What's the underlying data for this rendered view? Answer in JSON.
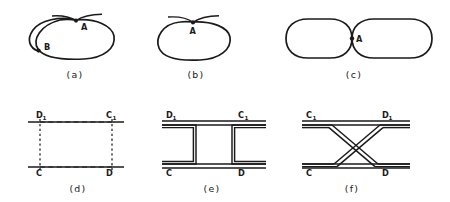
{
  "figure": {
    "background_color": "#ffffff",
    "ink_color": "#1a1a1a",
    "panel_count": 6
  },
  "panels": [
    {
      "id": "a",
      "caption": "(a)",
      "caption_x": 75,
      "caption_y": 78,
      "description": "closed loop with an interior sub-loop, marked points A and B",
      "labels": [
        {
          "name": "point-a",
          "text": "A",
          "subscript": "",
          "x": 81,
          "y": 30
        },
        {
          "name": "point-b",
          "text": "B",
          "subscript": "",
          "x": 44,
          "y": 50
        }
      ]
    },
    {
      "id": "b",
      "caption": "(b)",
      "caption_x": 196,
      "caption_y": 78,
      "description": "single closed loop with a wedge crossing at point A",
      "labels": [
        {
          "name": "point-a",
          "text": "A",
          "subscript": "",
          "x": 193,
          "y": 34
        }
      ]
    },
    {
      "id": "c",
      "caption": "(c)",
      "caption_x": 354,
      "caption_y": 78,
      "description": "two rounded lobes joined at a single point A",
      "labels": [
        {
          "name": "point-a",
          "text": "A",
          "subscript": "",
          "x": 354,
          "y": 42
        }
      ]
    },
    {
      "id": "d",
      "caption": "(d)",
      "caption_x": 78,
      "caption_y": 192,
      "description": "two horizontal solid lines joined by dashed rectangle sides",
      "labels": [
        {
          "name": "corner-d1",
          "text": "D",
          "subscript": "1",
          "x": 42,
          "y": 117
        },
        {
          "name": "corner-c1",
          "text": "C",
          "subscript": "1",
          "x": 110,
          "y": 117
        },
        {
          "name": "corner-c",
          "text": "C",
          "subscript": "",
          "x": 42,
          "y": 175
        },
        {
          "name": "corner-d",
          "text": "D",
          "subscript": "",
          "x": 110,
          "y": 175
        }
      ]
    },
    {
      "id": "e",
      "caption": "(e)",
      "caption_x": 212,
      "caption_y": 192,
      "description": "two double horizontal bands joined by facing bracket shapes",
      "labels": [
        {
          "name": "corner-d1",
          "text": "D",
          "subscript": "1",
          "x": 172,
          "y": 117
        },
        {
          "name": "corner-c1",
          "text": "C",
          "subscript": "1",
          "x": 244,
          "y": 117
        },
        {
          "name": "corner-c",
          "text": "C",
          "subscript": "",
          "x": 172,
          "y": 175
        },
        {
          "name": "corner-d",
          "text": "D",
          "subscript": "",
          "x": 244,
          "y": 175
        }
      ]
    },
    {
      "id": "f",
      "caption": "(f)",
      "caption_x": 352,
      "caption_y": 192,
      "description": "two double horizontal bands joined by crossing diagonal strips forming an X",
      "labels": [
        {
          "name": "corner-c1",
          "text": "C",
          "subscript": "1",
          "x": 312,
          "y": 117
        },
        {
          "name": "corner-d1",
          "text": "D",
          "subscript": "1",
          "x": 388,
          "y": 117
        },
        {
          "name": "corner-c",
          "text": "C",
          "subscript": "",
          "x": 312,
          "y": 175
        },
        {
          "name": "corner-d",
          "text": "D",
          "subscript": "",
          "x": 388,
          "y": 175
        }
      ]
    }
  ]
}
